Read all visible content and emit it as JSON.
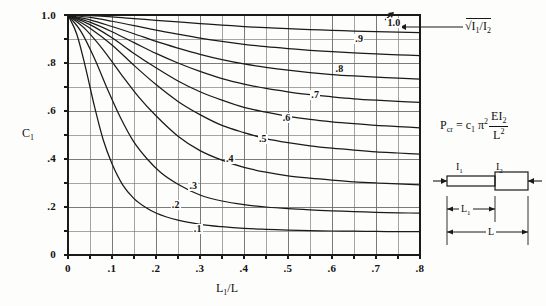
{
  "chart_data": {
    "type": "line",
    "title": "",
    "xlabel": "L1/L",
    "ylabel": "C1",
    "xlim": [
      0,
      0.8
    ],
    "ylim": [
      0,
      1.0
    ],
    "grid": true,
    "x_major_step": 0.1,
    "x_minor_step": 0.05,
    "y_major_step": 0.2,
    "y_minor_step": 0.1,
    "xticks": [
      "0",
      ".1",
      ".2",
      ".3",
      ".4",
      ".5",
      ".6",
      ".7",
      ".8"
    ],
    "xtick_values": [
      0,
      0.1,
      0.2,
      0.3,
      0.4,
      0.5,
      0.6,
      0.7,
      0.8
    ],
    "yticks": [
      "0",
      ".2",
      ".4",
      ".6",
      ".8",
      "1.0"
    ],
    "ytick_values": [
      0,
      0.2,
      0.4,
      0.6,
      0.8,
      1.0
    ],
    "legend_label": "√I₁/I₂",
    "legend_position": "right-of-plot-top",
    "series_parameter_name": "sqrt(I1/I2)",
    "series": [
      {
        "name": ".1",
        "label": ".1",
        "label_x": 0.295,
        "label_y": 0.105,
        "x": [
          0,
          0.02,
          0.04,
          0.06,
          0.08,
          0.1,
          0.125,
          0.15,
          0.175,
          0.2,
          0.25,
          0.3,
          0.35,
          0.4,
          0.45,
          0.5,
          0.55,
          0.6,
          0.65,
          0.7,
          0.75,
          0.8
        ],
        "values": [
          1.0,
          0.92,
          0.78,
          0.62,
          0.48,
          0.38,
          0.29,
          0.235,
          0.2,
          0.175,
          0.145,
          0.128,
          0.118,
          0.111,
          0.107,
          0.104,
          0.102,
          0.1,
          0.099,
          0.098,
          0.0975,
          0.097
        ]
      },
      {
        "name": ".2",
        "label": ".2",
        "label_x": 0.245,
        "label_y": 0.205,
        "x": [
          0,
          0.03,
          0.06,
          0.09,
          0.12,
          0.15,
          0.18,
          0.21,
          0.25,
          0.3,
          0.35,
          0.4,
          0.45,
          0.5,
          0.55,
          0.6,
          0.65,
          0.7,
          0.75,
          0.8
        ],
        "values": [
          1.0,
          0.93,
          0.82,
          0.69,
          0.57,
          0.47,
          0.4,
          0.345,
          0.295,
          0.25,
          0.225,
          0.21,
          0.2,
          0.193,
          0.188,
          0.184,
          0.181,
          0.178,
          0.176,
          0.174
        ]
      },
      {
        "name": ".3",
        "label": ".3",
        "label_x": 0.285,
        "label_y": 0.285,
        "x": [
          0,
          0.04,
          0.08,
          0.12,
          0.16,
          0.2,
          0.25,
          0.3,
          0.35,
          0.4,
          0.45,
          0.5,
          0.55,
          0.6,
          0.65,
          0.7,
          0.75,
          0.8
        ],
        "values": [
          1.0,
          0.94,
          0.855,
          0.755,
          0.66,
          0.58,
          0.495,
          0.435,
          0.395,
          0.365,
          0.345,
          0.33,
          0.32,
          0.312,
          0.305,
          0.3,
          0.296,
          0.292
        ]
      },
      {
        "name": ".4",
        "label": ".4",
        "label_x": 0.368,
        "label_y": 0.395,
        "x": [
          0,
          0.05,
          0.1,
          0.15,
          0.2,
          0.25,
          0.3,
          0.35,
          0.4,
          0.45,
          0.5,
          0.55,
          0.6,
          0.65,
          0.7,
          0.75,
          0.8
        ],
        "values": [
          1.0,
          0.945,
          0.875,
          0.79,
          0.71,
          0.64,
          0.585,
          0.54,
          0.51,
          0.485,
          0.468,
          0.455,
          0.445,
          0.437,
          0.43,
          0.425,
          0.42
        ]
      },
      {
        "name": ".5",
        "label": ".5",
        "label_x": 0.443,
        "label_y": 0.478,
        "x": [
          0,
          0.05,
          0.1,
          0.15,
          0.2,
          0.25,
          0.3,
          0.35,
          0.4,
          0.45,
          0.5,
          0.55,
          0.6,
          0.65,
          0.7,
          0.75,
          0.8
        ],
        "values": [
          1.0,
          0.96,
          0.905,
          0.84,
          0.78,
          0.725,
          0.68,
          0.645,
          0.615,
          0.595,
          0.578,
          0.565,
          0.555,
          0.547,
          0.54,
          0.535,
          0.53
        ]
      },
      {
        "name": ".6",
        "label": ".6",
        "label_x": 0.497,
        "label_y": 0.568,
        "x": [
          0,
          0.05,
          0.1,
          0.15,
          0.2,
          0.25,
          0.3,
          0.35,
          0.4,
          0.45,
          0.5,
          0.55,
          0.6,
          0.65,
          0.7,
          0.75,
          0.8
        ],
        "values": [
          1.0,
          0.97,
          0.93,
          0.885,
          0.84,
          0.8,
          0.765,
          0.735,
          0.712,
          0.694,
          0.68,
          0.668,
          0.659,
          0.651,
          0.645,
          0.64,
          0.636
        ]
      },
      {
        "name": ".7",
        "label": ".7",
        "label_x": 0.562,
        "label_y": 0.662,
        "x": [
          0,
          0.05,
          0.1,
          0.15,
          0.2,
          0.25,
          0.3,
          0.35,
          0.4,
          0.45,
          0.5,
          0.55,
          0.6,
          0.65,
          0.7,
          0.75,
          0.8
        ],
        "values": [
          1.0,
          0.98,
          0.952,
          0.922,
          0.89,
          0.862,
          0.836,
          0.814,
          0.796,
          0.782,
          0.77,
          0.76,
          0.752,
          0.746,
          0.741,
          0.737,
          0.733
        ]
      },
      {
        "name": ".8",
        "label": ".8",
        "label_x": 0.617,
        "label_y": 0.772,
        "x": [
          0,
          0.05,
          0.1,
          0.15,
          0.2,
          0.25,
          0.3,
          0.35,
          0.4,
          0.45,
          0.5,
          0.55,
          0.6,
          0.65,
          0.7,
          0.75,
          0.8
        ],
        "values": [
          1.0,
          0.99,
          0.974,
          0.956,
          0.937,
          0.92,
          0.904,
          0.89,
          0.878,
          0.868,
          0.86,
          0.853,
          0.847,
          0.842,
          0.838,
          0.834,
          0.831
        ]
      },
      {
        "name": ".9",
        "label": ".9",
        "label_x": 0.662,
        "label_y": 0.895,
        "x": [
          0,
          0.05,
          0.1,
          0.15,
          0.2,
          0.25,
          0.3,
          0.35,
          0.4,
          0.45,
          0.5,
          0.55,
          0.6,
          0.65,
          0.7,
          0.75,
          0.8
        ],
        "values": [
          1.0,
          0.997,
          0.992,
          0.985,
          0.978,
          0.971,
          0.964,
          0.958,
          0.952,
          0.947,
          0.943,
          0.939,
          0.936,
          0.933,
          0.931,
          0.929,
          0.927
        ]
      },
      {
        "name": "1.0",
        "label": "1.0",
        "label_x": 0.735,
        "label_y": 0.963,
        "x": [
          0,
          0.8
        ],
        "values": [
          1.0,
          1.0
        ]
      }
    ]
  },
  "axes": {
    "y_axis_title": "C",
    "y_axis_title_sub": "1",
    "x_axis_title": "L",
    "x_axis_title_sub": "1",
    "x_axis_title_tail": "/L"
  },
  "legend": {
    "radical": "√",
    "numerator": "I",
    "numerator_sub": "1",
    "denominator": "I",
    "denominator_sub": "2",
    "full_text": "√I₁/I₂"
  },
  "formula": {
    "lhs": "P",
    "lhs_sub": "cr",
    "eq": "=",
    "coef": "c",
    "coef_sub": "1",
    "pi": "π",
    "pi_sup": "2",
    "frac_num": "EI",
    "frac_num_sub": "2",
    "frac_den": "L",
    "frac_den_sup": "2",
    "full_text": "P_cr = c_1 π² EI₂ / L²"
  },
  "diagram": {
    "label_I1": "I",
    "label_I1_sub": "1",
    "label_I2": "I",
    "label_I2_sub": "2",
    "label_L1": "L",
    "label_L1_sub": "1",
    "label_L": "L"
  },
  "style": {
    "ink": "#1a1a1a",
    "grid": "#6b6b6b",
    "paper": "#fdfdfb"
  }
}
